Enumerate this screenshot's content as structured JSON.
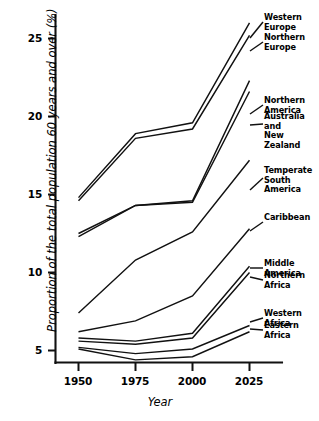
{
  "chart_data": {
    "type": "line",
    "title": "",
    "xlabel": "Year",
    "ylabel": "Proportion of the total population 60 years and over (%)",
    "x": [
      1950,
      1975,
      2000,
      2025
    ],
    "xticklabels": [
      "1950",
      "1975",
      "2000",
      "2025"
    ],
    "yticklabels": [
      "5",
      "10",
      "15",
      "20",
      "25"
    ],
    "ytickvalues": [
      5,
      10,
      15,
      20,
      25
    ],
    "xlim": [
      1941,
      2033
    ],
    "ylim": [
      3.5,
      26.5
    ],
    "grid": false,
    "legend_position": "right-inline-labels",
    "series": [
      {
        "name": "Western Europe",
        "label": "Western Europe",
        "values": [
          14.8,
          18.9,
          19.6,
          26.0
        ]
      },
      {
        "name": "Northern Europe",
        "label": "Northern Europe",
        "values": [
          14.6,
          18.6,
          19.2,
          25.2
        ]
      },
      {
        "name": "Northern America",
        "label": "Northern America",
        "values": [
          12.3,
          14.3,
          14.6,
          22.3
        ]
      },
      {
        "name": "Australia and New Zealand",
        "label": "Australia and\nNew Zealand",
        "values": [
          12.5,
          14.3,
          14.5,
          21.6
        ]
      },
      {
        "name": "Temperate South America",
        "label": "Temperate\nSouth America",
        "values": [
          7.4,
          10.8,
          12.6,
          17.2
        ]
      },
      {
        "name": "Caribbean",
        "label": "Caribbean",
        "values": [
          6.2,
          6.9,
          8.5,
          12.8
        ]
      },
      {
        "name": "Middle America",
        "label": "Middle America",
        "values": [
          5.8,
          5.6,
          6.1,
          10.4
        ]
      },
      {
        "name": "Northern Africa",
        "label": "Northern Africa",
        "values": [
          5.6,
          5.4,
          5.8,
          10.0
        ]
      },
      {
        "name": "Western Africa",
        "label": "Western Africa",
        "values": [
          5.2,
          4.8,
          5.1,
          6.6
        ]
      },
      {
        "name": "Eastern Africa",
        "label": "Eastern Africa",
        "values": [
          5.1,
          4.4,
          4.6,
          6.2
        ]
      }
    ]
  },
  "axes": {
    "x_title": "Year",
    "y_title": "Proportion of the total population 60 years and over (%)",
    "x_ticks": [
      "1950",
      "1975",
      "2000",
      "2025"
    ],
    "y_ticks": [
      "25",
      "20",
      "15",
      "10",
      "5"
    ]
  },
  "labels": {
    "western_europe": "Western Europe",
    "northern_europe": "Northern Europe",
    "northern_america": "Northern America",
    "australia_new_zealand": "Australia and\nNew Zealand",
    "temperate_south_america": "Temperate\nSouth America",
    "caribbean": "Caribbean",
    "middle_america": "Middle America",
    "northern_africa": "Northern Africa",
    "western_africa": "Western Africa",
    "eastern_africa": "Eastern Africa"
  },
  "colors": {
    "ink": "#111111",
    "background": "#ffffff"
  }
}
